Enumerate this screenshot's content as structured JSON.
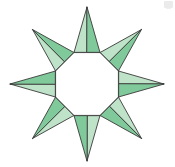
{
  "figure": {
    "background_color": "#ffffff",
    "canvas": {
      "width": 175,
      "height": 167
    },
    "center": {
      "x": 87,
      "y": 84
    },
    "point_count": 8,
    "inner_radius": 34,
    "outer_radius": 77,
    "rotation_offset_deg": -90,
    "hole_shape": "octagon",
    "hole_fill": "#ffffff",
    "stroke_color": "#3a3a3a",
    "stroke_width": 0.9,
    "palette": {
      "facet_light": "#bfe3c8",
      "facet_medium": "#7fc99a",
      "facet_dark": "#3da66a",
      "facet_base": "#54b883",
      "edge": "#3a3a3a"
    },
    "spikes": [
      {
        "index": 0,
        "angle_deg": -90,
        "label": "spike-top"
      },
      {
        "index": 1,
        "angle_deg": -45,
        "label": "spike-top-right"
      },
      {
        "index": 2,
        "angle_deg": 0,
        "label": "spike-right"
      },
      {
        "index": 3,
        "angle_deg": 45,
        "label": "spike-bottom-right"
      },
      {
        "index": 4,
        "angle_deg": 90,
        "label": "spike-bottom"
      },
      {
        "index": 5,
        "angle_deg": 135,
        "label": "spike-bottom-left"
      },
      {
        "index": 6,
        "angle_deg": 180,
        "label": "spike-left"
      },
      {
        "index": 7,
        "angle_deg": -135,
        "label": "spike-top-left"
      }
    ],
    "artifact": {
      "present": true,
      "label": "faint-gray-mark",
      "color": "#e8e8e8"
    }
  }
}
